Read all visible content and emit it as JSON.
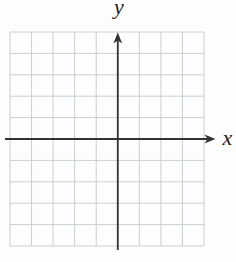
{
  "chart_data": {
    "type": "coordinate-grid",
    "title": "",
    "xlabel": "x",
    "ylabel": "y",
    "series": [],
    "grid": {
      "grid_on": true,
      "columns": 9,
      "rows": 10,
      "y_axis_column_index": 5,
      "x_axis_row_index": 5,
      "tick_labels": "none"
    },
    "axis_range_cells": {
      "x": [
        -5,
        4
      ],
      "y": [
        -5,
        5
      ]
    },
    "layout": {
      "plot_area_px": {
        "left": 10,
        "top": 32,
        "width": 194,
        "height": 214
      },
      "x_axis_px": {
        "line_start_x": 5,
        "tip_x": 215.5
      },
      "y_axis_px": {
        "line_end_y": 250,
        "tip_y": 32.5
      },
      "arrow_px": {
        "length": 11,
        "half_width": 4.4
      },
      "axis_stroke_width": 1.8,
      "grid_stroke_width": 1
    }
  },
  "colors": {
    "background": "#fdfdfd",
    "grid_line": "#cdced2",
    "axis_line": "#333333",
    "label": "#1d1d1d"
  }
}
